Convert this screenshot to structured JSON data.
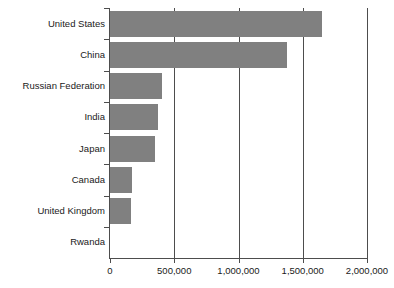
{
  "chart_data": {
    "type": "bar",
    "orientation": "horizontal",
    "title": "",
    "subtitle": "",
    "xlabel": "",
    "ylabel": "",
    "categories": [
      "United States",
      "China",
      "Russian Federation",
      "India",
      "Japan",
      "Canada",
      "United Kingdom",
      "Rwanda"
    ],
    "values": [
      1650000,
      1375000,
      405000,
      375000,
      350000,
      170000,
      160000,
      0
    ],
    "series": [
      {
        "name": "",
        "values": [
          1650000,
          1375000,
          405000,
          375000,
          350000,
          170000,
          160000,
          0
        ]
      }
    ],
    "xlim": [
      0,
      2000000
    ],
    "xticks": [
      0,
      500000,
      1000000,
      1500000,
      2000000
    ],
    "xtick_labels": [
      "0",
      "500,000",
      "1,000,000",
      "1,500,000",
      "2,000,000"
    ],
    "grid": true,
    "grid_axis": "x",
    "legend": false,
    "legend_position": "none",
    "bar_color": "#808080",
    "axis_color": "#4d4d4d",
    "background_color": "#ffffff"
  },
  "axis": {
    "ticks": [
      {
        "label": "0",
        "value": 0
      },
      {
        "label": "500,000",
        "value": 500000
      },
      {
        "label": "1,000,000",
        "value": 1000000
      },
      {
        "label": "1,500,000",
        "value": 1500000
      },
      {
        "label": "2,000,000",
        "value": 2000000
      }
    ]
  },
  "bars": [
    {
      "label": "United States",
      "value": 1650000
    },
    {
      "label": "China",
      "value": 1375000
    },
    {
      "label": "Russian Federation",
      "value": 405000
    },
    {
      "label": "India",
      "value": 375000
    },
    {
      "label": "Japan",
      "value": 350000
    },
    {
      "label": "Canada",
      "value": 170000
    },
    {
      "label": "United Kingdom",
      "value": 160000
    },
    {
      "label": "Rwanda",
      "value": 0
    }
  ]
}
